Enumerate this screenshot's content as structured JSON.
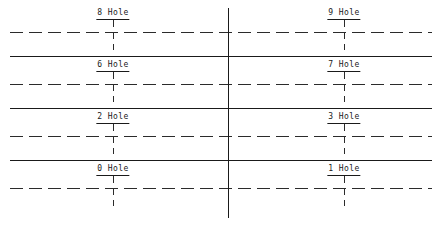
{
  "drawing": {
    "title": "Hole location layout",
    "colors": {
      "line": "#1a1a1a",
      "centerline": "#2b2b2b",
      "background": "#ffffff",
      "text": "#1a1a1a"
    },
    "canvas": {
      "width": 442,
      "height": 226
    },
    "vertical_centerline": {
      "x": 228,
      "y1": 8,
      "y2": 218,
      "style": "solid"
    },
    "solid_rules": [
      {
        "y": 56,
        "x1": 10,
        "x2": 432
      },
      {
        "y": 108,
        "x1": 10,
        "x2": 432
      },
      {
        "y": 160,
        "x1": 10,
        "x2": 432
      }
    ],
    "dashed_centerlines": [
      {
        "y": 32,
        "x1": 10,
        "x2": 432
      },
      {
        "y": 84,
        "x1": 10,
        "x2": 432
      },
      {
        "y": 136,
        "x1": 10,
        "x2": 432
      },
      {
        "y": 188,
        "x1": 10,
        "x2": 432
      }
    ],
    "rows": [
      {
        "centerline_y": 32,
        "label_y": 8,
        "left": {
          "text": "8 Hole",
          "x": 113
        },
        "right": {
          "text": "9 Hole",
          "x": 344
        }
      },
      {
        "centerline_y": 84,
        "label_y": 60,
        "left": {
          "text": "6 Hole",
          "x": 113
        },
        "right": {
          "text": "7 Hole",
          "x": 344
        }
      },
      {
        "centerline_y": 136,
        "label_y": 112,
        "left": {
          "text": "2 Hole",
          "x": 113
        },
        "right": {
          "text": "3 Hole",
          "x": 344
        }
      },
      {
        "centerline_y": 188,
        "label_y": 164,
        "left": {
          "text": "0 Hole",
          "x": 113
        },
        "right": {
          "text": "1 Hole",
          "x": 344
        }
      }
    ]
  }
}
